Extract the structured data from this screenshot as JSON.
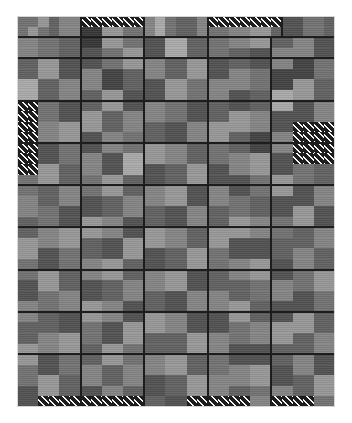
{
  "figure": {
    "title": "",
    "background_color": "#ffffff",
    "plot_background_color": "#6e6e6e",
    "block_outline_color": "#1d1d1d",
    "frame_color": "#d8d8d8"
  },
  "chart_data": {
    "type": "heatmap",
    "title": "",
    "subtitle": "",
    "xlabel": "",
    "ylabel": "",
    "legend": [],
    "annotations": [],
    "grid": false,
    "legend_position": "none",
    "columns": 30,
    "rows": 37,
    "cell_size_px": 10.6,
    "xlim": [
      0,
      30
    ],
    "ylim": [
      0,
      37
    ],
    "value_scale": {
      "min": 0,
      "max": 9,
      "colors": [
        "#2a2a2a",
        "#373737",
        "#434343",
        "#525252",
        "#616161",
        "#727272",
        "#848484",
        "#979797",
        "#a9a9a9",
        "#bdbdbd"
      ]
    },
    "hatch_value": -1,
    "values": [
      [
        5,
        5,
        7,
        4,
        6,
        6,
        -1,
        -1,
        -1,
        -1,
        -1,
        -1,
        6,
        8,
        5,
        4,
        4,
        6,
        -1,
        -1,
        -1,
        -1,
        -1,
        -1,
        -1,
        3,
        3,
        5,
        5,
        4
      ],
      [
        5,
        7,
        5,
        4,
        6,
        6,
        1,
        1,
        7,
        7,
        5,
        5,
        6,
        8,
        5,
        4,
        4,
        6,
        5,
        5,
        6,
        6,
        7,
        7,
        4,
        3,
        3,
        5,
        5,
        4
      ],
      [
        6,
        6,
        5,
        5,
        4,
        4,
        1,
        1,
        7,
        7,
        5,
        5,
        3,
        3,
        8,
        8,
        4,
        4,
        5,
        5,
        6,
        6,
        7,
        7,
        4,
        4,
        6,
        6,
        3,
        3
      ],
      [
        6,
        6,
        5,
        5,
        4,
        4,
        3,
        3,
        5,
        5,
        7,
        7,
        3,
        3,
        8,
        8,
        4,
        4,
        5,
        5,
        4,
        4,
        3,
        3,
        6,
        6,
        6,
        6,
        3,
        3
      ],
      [
        4,
        4,
        7,
        7,
        3,
        3,
        3,
        3,
        5,
        5,
        7,
        7,
        6,
        6,
        4,
        4,
        7,
        7,
        3,
        3,
        4,
        4,
        3,
        3,
        6,
        6,
        2,
        2,
        5,
        5
      ],
      [
        4,
        4,
        7,
        7,
        3,
        3,
        6,
        6,
        2,
        2,
        4,
        4,
        6,
        6,
        4,
        4,
        7,
        7,
        3,
        3,
        6,
        6,
        5,
        5,
        2,
        2,
        2,
        2,
        5,
        5
      ],
      [
        8,
        8,
        4,
        4,
        6,
        6,
        6,
        6,
        2,
        2,
        4,
        4,
        3,
        3,
        7,
        7,
        5,
        5,
        6,
        6,
        6,
        6,
        5,
        5,
        2,
        2,
        7,
        7,
        4,
        4
      ],
      [
        8,
        8,
        4,
        4,
        6,
        6,
        4,
        4,
        7,
        7,
        3,
        3,
        3,
        3,
        7,
        7,
        5,
        5,
        6,
        6,
        3,
        3,
        4,
        4,
        8,
        8,
        7,
        7,
        4,
        4
      ],
      [
        -1,
        -1,
        5,
        5,
        3,
        3,
        4,
        4,
        7,
        7,
        3,
        3,
        6,
        6,
        5,
        5,
        3,
        3,
        4,
        4,
        3,
        3,
        4,
        4,
        8,
        8,
        3,
        3,
        6,
        6
      ],
      [
        -1,
        -1,
        5,
        5,
        3,
        3,
        7,
        7,
        4,
        4,
        6,
        6,
        6,
        6,
        5,
        5,
        3,
        3,
        4,
        4,
        7,
        7,
        6,
        6,
        3,
        3,
        3,
        3,
        6,
        6
      ],
      [
        -1,
        -1,
        6,
        6,
        7,
        7,
        7,
        7,
        4,
        4,
        6,
        6,
        4,
        4,
        3,
        3,
        6,
        6,
        7,
        7,
        7,
        7,
        6,
        6,
        3,
        3,
        -1,
        -1,
        -1,
        -1
      ],
      [
        -1,
        -1,
        6,
        6,
        7,
        7,
        3,
        3,
        6,
        6,
        5,
        5,
        4,
        4,
        3,
        3,
        6,
        6,
        7,
        7,
        4,
        4,
        2,
        2,
        6,
        6,
        -1,
        -1,
        -1,
        -1
      ],
      [
        -1,
        -1,
        3,
        3,
        5,
        5,
        3,
        3,
        6,
        6,
        5,
        5,
        7,
        7,
        6,
        6,
        4,
        4,
        5,
        5,
        4,
        4,
        2,
        2,
        6,
        6,
        -1,
        -1,
        -1,
        -1
      ],
      [
        -1,
        -1,
        3,
        3,
        5,
        5,
        6,
        6,
        3,
        3,
        8,
        8,
        7,
        7,
        6,
        6,
        4,
        4,
        5,
        5,
        6,
        6,
        7,
        7,
        3,
        3,
        -1,
        -1,
        -1,
        -1
      ],
      [
        -1,
        -1,
        7,
        7,
        4,
        4,
        6,
        6,
        3,
        3,
        8,
        8,
        3,
        3,
        4,
        4,
        7,
        7,
        3,
        3,
        6,
        6,
        7,
        7,
        3,
        3,
        5,
        5,
        4,
        4
      ],
      [
        5,
        5,
        7,
        7,
        4,
        4,
        5,
        5,
        7,
        7,
        4,
        4,
        3,
        3,
        4,
        4,
        7,
        7,
        3,
        3,
        3,
        3,
        5,
        5,
        7,
        7,
        5,
        5,
        4,
        4
      ],
      [
        5,
        5,
        4,
        4,
        6,
        6,
        5,
        5,
        7,
        7,
        4,
        4,
        6,
        6,
        7,
        7,
        3,
        3,
        6,
        6,
        3,
        3,
        5,
        5,
        7,
        7,
        3,
        3,
        6,
        6
      ],
      [
        6,
        6,
        4,
        4,
        6,
        6,
        3,
        3,
        4,
        4,
        6,
        6,
        6,
        6,
        7,
        7,
        3,
        3,
        6,
        6,
        5,
        5,
        4,
        4,
        3,
        3,
        3,
        3,
        6,
        6
      ],
      [
        6,
        6,
        5,
        5,
        3,
        3,
        3,
        3,
        4,
        4,
        6,
        6,
        4,
        4,
        3,
        3,
        6,
        6,
        4,
        4,
        5,
        5,
        4,
        4,
        3,
        3,
        7,
        7,
        3,
        3
      ],
      [
        4,
        4,
        5,
        5,
        3,
        3,
        7,
        7,
        6,
        6,
        3,
        3,
        4,
        4,
        3,
        3,
        6,
        6,
        4,
        4,
        7,
        7,
        6,
        6,
        5,
        5,
        7,
        7,
        3,
        3
      ],
      [
        4,
        4,
        6,
        6,
        7,
        7,
        7,
        7,
        6,
        6,
        3,
        3,
        7,
        7,
        6,
        6,
        4,
        4,
        7,
        7,
        7,
        7,
        6,
        6,
        5,
        5,
        4,
        4,
        6,
        6
      ],
      [
        7,
        7,
        6,
        6,
        7,
        7,
        4,
        4,
        3,
        3,
        7,
        7,
        7,
        7,
        6,
        6,
        4,
        4,
        7,
        7,
        3,
        3,
        3,
        3,
        4,
        4,
        4,
        4,
        6,
        6
      ],
      [
        7,
        7,
        3,
        3,
        5,
        5,
        4,
        4,
        3,
        3,
        7,
        7,
        3,
        3,
        4,
        4,
        7,
        7,
        5,
        5,
        3,
        3,
        3,
        3,
        4,
        4,
        6,
        6,
        4,
        4
      ],
      [
        5,
        5,
        3,
        3,
        5,
        5,
        6,
        6,
        7,
        7,
        4,
        4,
        3,
        3,
        4,
        4,
        7,
        7,
        5,
        5,
        6,
        6,
        7,
        7,
        3,
        3,
        6,
        6,
        4,
        4
      ],
      [
        5,
        5,
        7,
        7,
        4,
        4,
        6,
        6,
        7,
        7,
        4,
        4,
        6,
        6,
        7,
        7,
        3,
        3,
        4,
        4,
        6,
        6,
        7,
        7,
        3,
        3,
        5,
        5,
        7,
        7
      ],
      [
        3,
        3,
        7,
        7,
        4,
        4,
        3,
        3,
        4,
        4,
        6,
        6,
        6,
        6,
        7,
        7,
        3,
        3,
        4,
        4,
        4,
        4,
        5,
        5,
        6,
        6,
        5,
        5,
        7,
        7
      ],
      [
        3,
        3,
        5,
        5,
        6,
        6,
        3,
        3,
        4,
        4,
        6,
        6,
        4,
        4,
        3,
        3,
        6,
        6,
        6,
        6,
        4,
        4,
        5,
        5,
        6,
        6,
        3,
        3,
        5,
        5
      ],
      [
        6,
        6,
        5,
        5,
        6,
        6,
        7,
        7,
        6,
        6,
        3,
        3,
        4,
        4,
        3,
        3,
        6,
        6,
        6,
        6,
        7,
        7,
        4,
        4,
        3,
        3,
        3,
        3,
        5,
        5
      ],
      [
        6,
        6,
        4,
        4,
        3,
        3,
        7,
        7,
        6,
        6,
        3,
        3,
        7,
        7,
        6,
        6,
        3,
        3,
        3,
        3,
        7,
        7,
        4,
        4,
        3,
        3,
        7,
        7,
        4,
        4
      ],
      [
        4,
        4,
        4,
        4,
        3,
        3,
        5,
        5,
        3,
        3,
        7,
        7,
        7,
        7,
        6,
        6,
        3,
        3,
        3,
        3,
        5,
        5,
        6,
        6,
        7,
        7,
        7,
        7,
        4,
        4
      ],
      [
        4,
        4,
        6,
        6,
        7,
        7,
        5,
        5,
        3,
        3,
        7,
        7,
        4,
        4,
        4,
        4,
        7,
        7,
        6,
        6,
        5,
        5,
        6,
        6,
        7,
        7,
        4,
        4,
        6,
        6
      ],
      [
        7,
        7,
        6,
        6,
        7,
        7,
        4,
        4,
        7,
        7,
        5,
        5,
        4,
        4,
        4,
        4,
        7,
        7,
        6,
        6,
        3,
        3,
        3,
        3,
        4,
        4,
        4,
        4,
        6,
        6
      ],
      [
        7,
        7,
        3,
        3,
        5,
        5,
        4,
        4,
        7,
        7,
        5,
        5,
        6,
        6,
        7,
        7,
        4,
        4,
        5,
        5,
        3,
        3,
        3,
        3,
        4,
        4,
        6,
        6,
        3,
        3
      ],
      [
        5,
        5,
        3,
        3,
        5,
        5,
        6,
        6,
        4,
        4,
        6,
        6,
        6,
        6,
        7,
        7,
        4,
        4,
        5,
        5,
        6,
        6,
        7,
        7,
        3,
        3,
        6,
        6,
        3,
        3
      ],
      [
        5,
        5,
        7,
        7,
        4,
        4,
        6,
        6,
        4,
        4,
        6,
        6,
        3,
        3,
        4,
        4,
        7,
        7,
        6,
        6,
        6,
        6,
        7,
        7,
        3,
        3,
        4,
        4,
        7,
        7
      ],
      [
        3,
        3,
        7,
        7,
        4,
        4,
        3,
        3,
        6,
        6,
        4,
        4,
        3,
        3,
        4,
        4,
        7,
        7,
        6,
        6,
        4,
        4,
        5,
        5,
        6,
        6,
        4,
        4,
        7,
        7
      ],
      [
        3,
        3,
        -1,
        -1,
        -1,
        -1,
        -1,
        -1,
        -1,
        -1,
        -1,
        -1,
        4,
        4,
        3,
        3,
        -1,
        -1,
        -1,
        -1,
        -1,
        -1,
        6,
        6,
        -1,
        -1,
        -1,
        -1,
        5,
        5
      ]
    ],
    "blocks": [
      {
        "col": 0,
        "row": 0,
        "w": 6,
        "h": 2
      },
      {
        "col": 6,
        "row": 0,
        "w": 6,
        "h": 2
      },
      {
        "col": 12,
        "row": 0,
        "w": 6,
        "h": 2
      },
      {
        "col": 18,
        "row": 0,
        "w": 7,
        "h": 2
      },
      {
        "col": 25,
        "row": 0,
        "w": 5,
        "h": 2
      },
      {
        "col": 0,
        "row": 2,
        "w": 6,
        "h": 2
      },
      {
        "col": 6,
        "row": 2,
        "w": 6,
        "h": 2
      },
      {
        "col": 12,
        "row": 2,
        "w": 6,
        "h": 2
      },
      {
        "col": 18,
        "row": 2,
        "w": 6,
        "h": 2
      },
      {
        "col": 24,
        "row": 2,
        "w": 6,
        "h": 2
      },
      {
        "col": 0,
        "row": 4,
        "w": 6,
        "h": 4
      },
      {
        "col": 6,
        "row": 4,
        "w": 6,
        "h": 4
      },
      {
        "col": 12,
        "row": 4,
        "w": 6,
        "h": 4
      },
      {
        "col": 18,
        "row": 4,
        "w": 6,
        "h": 4
      },
      {
        "col": 24,
        "row": 4,
        "w": 6,
        "h": 4
      },
      {
        "col": 0,
        "row": 8,
        "w": 6,
        "h": 4
      },
      {
        "col": 6,
        "row": 8,
        "w": 6,
        "h": 4
      },
      {
        "col": 12,
        "row": 8,
        "w": 6,
        "h": 4
      },
      {
        "col": 18,
        "row": 8,
        "w": 6,
        "h": 4
      },
      {
        "col": 24,
        "row": 8,
        "w": 6,
        "h": 4
      },
      {
        "col": 0,
        "row": 12,
        "w": 6,
        "h": 4
      },
      {
        "col": 6,
        "row": 12,
        "w": 6,
        "h": 4
      },
      {
        "col": 12,
        "row": 12,
        "w": 6,
        "h": 4
      },
      {
        "col": 18,
        "row": 12,
        "w": 6,
        "h": 4
      },
      {
        "col": 24,
        "row": 12,
        "w": 6,
        "h": 4
      },
      {
        "col": 0,
        "row": 16,
        "w": 6,
        "h": 4
      },
      {
        "col": 6,
        "row": 16,
        "w": 6,
        "h": 4
      },
      {
        "col": 12,
        "row": 16,
        "w": 6,
        "h": 4
      },
      {
        "col": 18,
        "row": 16,
        "w": 6,
        "h": 4
      },
      {
        "col": 24,
        "row": 16,
        "w": 6,
        "h": 4
      },
      {
        "col": 0,
        "row": 20,
        "w": 6,
        "h": 4
      },
      {
        "col": 6,
        "row": 20,
        "w": 6,
        "h": 4
      },
      {
        "col": 12,
        "row": 20,
        "w": 6,
        "h": 4
      },
      {
        "col": 18,
        "row": 20,
        "w": 6,
        "h": 4
      },
      {
        "col": 24,
        "row": 20,
        "w": 6,
        "h": 4
      },
      {
        "col": 0,
        "row": 24,
        "w": 6,
        "h": 4
      },
      {
        "col": 6,
        "row": 24,
        "w": 6,
        "h": 4
      },
      {
        "col": 12,
        "row": 24,
        "w": 6,
        "h": 4
      },
      {
        "col": 18,
        "row": 24,
        "w": 6,
        "h": 4
      },
      {
        "col": 24,
        "row": 24,
        "w": 6,
        "h": 4
      },
      {
        "col": 0,
        "row": 28,
        "w": 6,
        "h": 4
      },
      {
        "col": 6,
        "row": 28,
        "w": 6,
        "h": 4
      },
      {
        "col": 12,
        "row": 28,
        "w": 6,
        "h": 4
      },
      {
        "col": 18,
        "row": 28,
        "w": 6,
        "h": 4
      },
      {
        "col": 24,
        "row": 28,
        "w": 6,
        "h": 4
      },
      {
        "col": 0,
        "row": 32,
        "w": 6,
        "h": 5
      },
      {
        "col": 6,
        "row": 32,
        "w": 6,
        "h": 5
      },
      {
        "col": 12,
        "row": 32,
        "w": 6,
        "h": 5
      },
      {
        "col": 18,
        "row": 32,
        "w": 6,
        "h": 5
      },
      {
        "col": 24,
        "row": 32,
        "w": 6,
        "h": 5
      }
    ]
  }
}
